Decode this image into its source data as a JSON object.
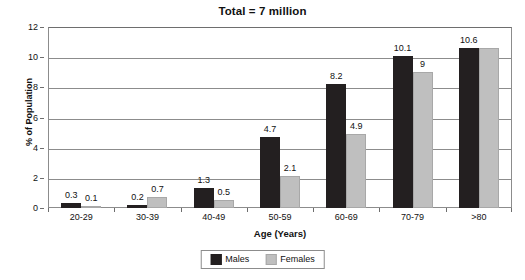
{
  "chart_data": {
    "type": "bar",
    "title": "Total = 7 million",
    "xlabel": "Age (Years)",
    "ylabel": "% of Population",
    "categories": [
      "20-29",
      "30-39",
      "40-49",
      "50-59",
      "60-69",
      "70-79",
      ">80"
    ],
    "series": [
      {
        "name": "Males",
        "color": "#231f20",
        "values": [
          0.3,
          0.2,
          1.3,
          4.7,
          8.2,
          10.1,
          10.6
        ],
        "labels": [
          "0.3",
          "0.2",
          "1.3",
          "4.7",
          "8.2",
          "10.1",
          "10.6"
        ]
      },
      {
        "name": "Females",
        "color": "#bfbfbf",
        "values": [
          0.1,
          0.7,
          0.5,
          2.1,
          4.9,
          9,
          10.6
        ],
        "labels": [
          "0.1",
          "0.7",
          "0.5",
          "2.1",
          "4.9",
          "9",
          ""
        ]
      }
    ],
    "ylim": [
      0,
      12
    ],
    "yticks": [
      0,
      2,
      4,
      6,
      8,
      10,
      12
    ],
    "ytick_labels": [
      "0",
      "2",
      "4",
      "6",
      "8",
      "10",
      "12"
    ],
    "grid": true,
    "legend_position": "bottom-center"
  },
  "legend": {
    "items": [
      {
        "label": "Males"
      },
      {
        "label": "Females"
      }
    ]
  }
}
